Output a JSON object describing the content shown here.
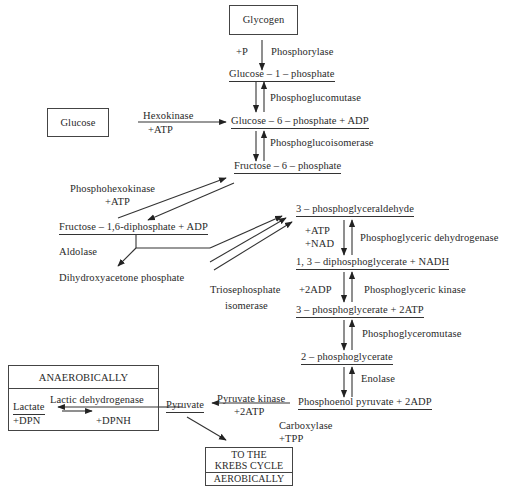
{
  "boxes": {
    "glycogen": "Glycogen",
    "glucose": "Glucose",
    "anaerobic_title": "ANAEROBICALLY",
    "krebs_line1": "TO THE",
    "krebs_line2": "KREBS CYCLE",
    "krebs_line3": "AEROBICALLY"
  },
  "metabolites": {
    "g1p": "Glucose – 1 – phosphate",
    "g6p": "Glucose – 6 – phosphate + ADP",
    "f6p": "Fructose – 6 – phosphate",
    "f16dp": "Fructose – 1,6-diphosphate + ADP",
    "dhap": "Dihydroxyacetone phosphate",
    "g3p": "3 – phosphoglyceraldehyde",
    "bpg": "1, 3 – diphosphoglycerate + NADH",
    "pg3": "3 – phosphoglycerate + 2ATP",
    "pg2": "2 – phosphoglycerate",
    "pep": "Phosphoenol pyruvate + 2ADP",
    "pyruvate": "Pyruvate",
    "lactate": "Lactate",
    "plus_dpn": "+DPN",
    "plus_dpnh": "+DPNH"
  },
  "enzymes": {
    "plus_p": "+P",
    "phosphorylase": "Phosphorylase",
    "phosphoglucomutase": "Phosphoglucomutase",
    "hexokinase": "Hexokinase",
    "hexokinase_atp": "+ATP",
    "phosphoglucoisomerase": "Phosphoglucoisomerase",
    "phosphohexokinase": "Phosphohexokinase",
    "phosphohexokinase_atp": "+ATP",
    "aldolase": "Aldolase",
    "triose_line1": "Triosephosphate",
    "triose_line2": "isomerase",
    "atp_nad_1": "+ATP",
    "atp_nad_2": "+NAD",
    "pg_dehydrogenase": "Phosphoglyceric  dehydrogenase",
    "plus_2adp": "+2ADP",
    "pg_kinase": "Phosphoglyceric kinase",
    "pg_mutase": "Phosphoglyceromutase",
    "enolase": "Enolase",
    "pyruvate_kinase": "Pyruvate kinase",
    "pyruvate_kinase_atp": "+2ATP",
    "carboxylase": "Carboxylase",
    "tpp": "+TPP",
    "lactic_dh": "Lactic dehydrogenase"
  }
}
